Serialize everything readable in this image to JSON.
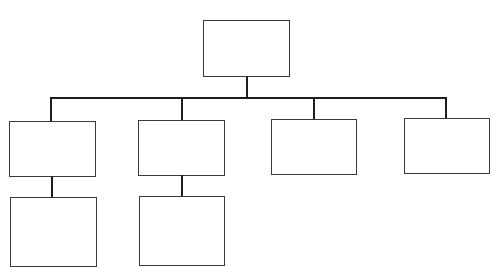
{
  "diagram": {
    "type": "org-chart",
    "top_text_cropped": "",
    "line_color": "#1e1e1e",
    "box_border_color": "#3a3a3a",
    "root": {
      "label": "",
      "children": [
        {
          "label": "",
          "children": [
            {
              "label": ""
            }
          ]
        },
        {
          "label": "",
          "children": [
            {
              "label": ""
            }
          ]
        },
        {
          "label": "",
          "children": []
        },
        {
          "label": "",
          "children": []
        }
      ]
    }
  }
}
